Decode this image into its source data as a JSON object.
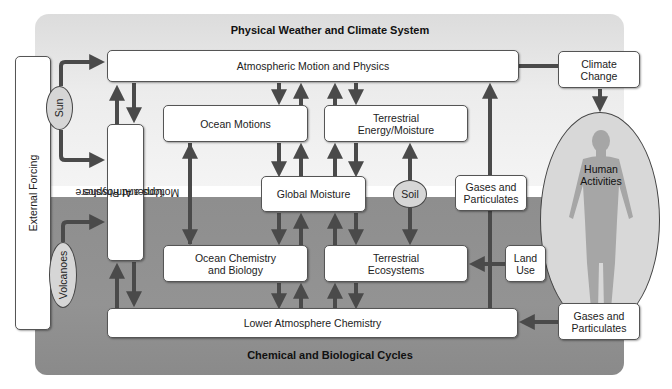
{
  "sections": {
    "top_title": "Physical Weather and Climate System",
    "bottom_title": "Chemical and Biological Cycles"
  },
  "nodes": {
    "external_forcing": "External Forcing",
    "sun": "Sun",
    "volcanoes": "Volcanoes",
    "atmospheric_motion": "Atmospheric Motion and Physics",
    "upper_atmosphere": [
      "Upper Atmosphere",
      "Motions and Physics"
    ],
    "ocean_motions": "Ocean Motions",
    "terrestrial_energy": [
      "Terrestrial",
      "Energy/Moisture"
    ],
    "global_moisture": "Global Moisture",
    "soil": "Soil",
    "gases_upper": [
      "Gases and",
      "Particulates"
    ],
    "climate_change": [
      "Climate",
      "Change"
    ],
    "human_activities": [
      "Human",
      "Activities"
    ],
    "ocean_chemistry": [
      "Ocean Chemistry",
      "and Biology"
    ],
    "terrestrial_ecosystems": [
      "Terrestrial",
      "Ecosystems"
    ],
    "land_use": [
      "Land",
      "Use"
    ],
    "lower_atmosphere": "Lower Atmosphere Chemistry",
    "gases_lower": [
      "Gases and",
      "Particulates"
    ]
  },
  "colors": {
    "arrow": "#4a4a4a",
    "top_region": "#ececec",
    "bottom_region": "#8e8e8e",
    "box_fill": "#ffffff",
    "ellipse_fill": "#d6d6d6",
    "human_figure": "#a6a6a6"
  }
}
